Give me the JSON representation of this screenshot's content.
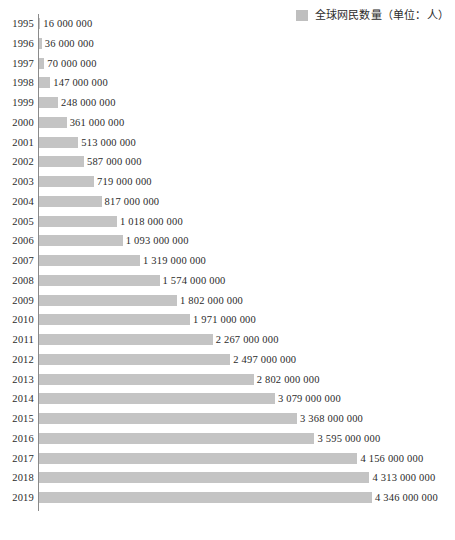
{
  "legend": {
    "label": "全球网民数量（单位：人）",
    "swatch_color": "#bfbfbf",
    "swatch_name": "legend-color-swatch"
  },
  "axis": {
    "color": "#8a8a8a"
  },
  "caption": {
    "text": ""
  },
  "chart_data": {
    "type": "bar",
    "orientation": "horizontal",
    "title": "",
    "subtitle": "",
    "xlabel": "",
    "ylabel": "",
    "grid": false,
    "legend_position": "top-right",
    "series": [
      {
        "name": "全球网民数量（单位：人）",
        "color": "#c4c4c4",
        "values": [
          16000000,
          36000000,
          70000000,
          147000000,
          248000000,
          361000000,
          513000000,
          587000000,
          719000000,
          817000000,
          1018000000,
          1093000000,
          1319000000,
          1574000000,
          1802000000,
          1971000000,
          2267000000,
          2497000000,
          2802000000,
          3079000000,
          3368000000,
          3595000000,
          4156000000,
          4313000000,
          4346000000
        ]
      }
    ],
    "categories": [
      "1995",
      "1996",
      "1997",
      "1998",
      "1999",
      "2000",
      "2001",
      "2002",
      "2003",
      "2004",
      "2005",
      "2006",
      "2007",
      "2008",
      "2009",
      "2010",
      "2011",
      "2012",
      "2013",
      "2014",
      "2015",
      "2016",
      "2017",
      "2018",
      "2019"
    ],
    "value_labels": [
      "16 000 000",
      "36 000 000",
      "70 000 000",
      "147 000 000",
      "248 000 000",
      "361 000 000",
      "513 000 000",
      "587 000 000",
      "719 000 000",
      "817 000 000",
      "1 018 000 000",
      "1 093 000 000",
      "1 319 000 000",
      "1 574 000 000",
      "1 802 000 000",
      "1 971 000 000",
      "2 267 000 000",
      "2 497 000 000",
      "2 802 000 000",
      "3 079 000 000",
      "3 368 000 000",
      "3 595 000 000",
      "4 156 000 000",
      "4 313 000 000",
      "4 346 000 000"
    ],
    "xlim": [
      0,
      4346000000
    ]
  }
}
